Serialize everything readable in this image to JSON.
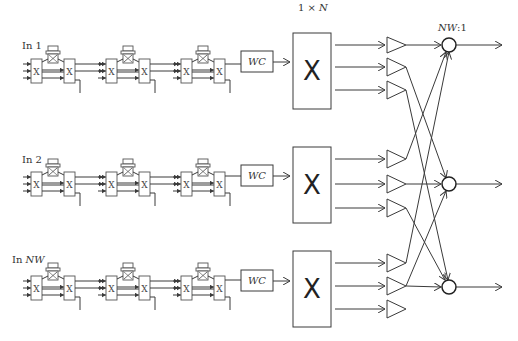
{
  "diagram": {
    "type": "optical switch architecture",
    "inputs": [
      {
        "label_prefix": "In ",
        "label_var": "1"
      },
      {
        "label_prefix": "In ",
        "label_var": "2"
      },
      {
        "label_prefix": "In ",
        "label_var": "NW"
      }
    ],
    "stage_switch_symbol": "X",
    "wavelength_converter_label": "WC",
    "splitter_label_prefix": "1 × ",
    "splitter_label_var": "N",
    "splitter_symbol": "X",
    "combiner_label_var": "NW",
    "combiner_label_suffix": ":1",
    "stages_per_input": 3,
    "outputs_per_splitter": 3,
    "combiners": 3
  }
}
